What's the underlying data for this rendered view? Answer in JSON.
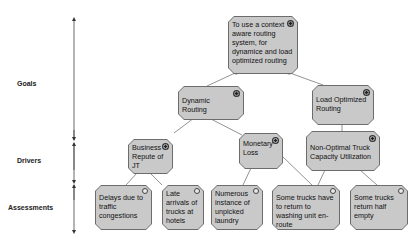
{
  "levels": [
    {
      "label": "Goals"
    },
    {
      "label": "Drivers"
    },
    {
      "label": "Assessments"
    }
  ],
  "nodes": {
    "root_goal": {
      "text": "To use a context aware routing system, for dynamice and load optimized routing",
      "type": "goal"
    },
    "dynamic_routing": {
      "text": "Dynamic Routing",
      "type": "goal"
    },
    "load_optimized_routing": {
      "text": "Load Optimized Routing",
      "type": "goal"
    },
    "business_repute": {
      "text": "Business Repute of JT",
      "type": "driver"
    },
    "monetary_loss": {
      "text": "Monetary Loss",
      "type": "driver"
    },
    "non_optimal_capacity": {
      "text": "Non-Optimal Truck Capacity Utilization",
      "type": "driver"
    },
    "delays_traffic": {
      "text": "Delays due to traffic congestions",
      "type": "assessment"
    },
    "late_arrivals": {
      "text": "Late arrivals of trucks at hotels",
      "type": "assessment"
    },
    "unpicked_laundry": {
      "text": "Numerous instance of unpicked laundry",
      "type": "assessment"
    },
    "return_washing": {
      "text": "Some trucks have to return to washing unit en-route",
      "type": "assessment"
    },
    "return_half_empty": {
      "text": "Some trucks return half empty",
      "type": "assessment"
    }
  },
  "colors": {
    "node_fill": "#c9c9c9",
    "node_border": "#6c6c6c",
    "edge": "#777777"
  }
}
